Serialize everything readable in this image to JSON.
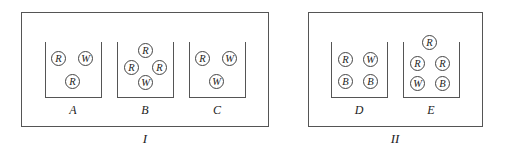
{
  "groups": [
    {
      "label": "I",
      "containers": [
        {
          "label": "A",
          "balls": [
            "R",
            "W",
            "R"
          ]
        },
        {
          "label": "B",
          "balls": [
            "R",
            "R",
            "R",
            "W"
          ]
        },
        {
          "label": "C",
          "balls": [
            "R",
            "W",
            "W"
          ]
        }
      ]
    },
    {
      "label": "II",
      "containers": [
        {
          "label": "D",
          "balls": [
            "R",
            "W",
            "B",
            "B"
          ]
        },
        {
          "label": "E",
          "balls": [
            "R",
            "R",
            "R",
            "W",
            "B"
          ]
        }
      ]
    }
  ]
}
